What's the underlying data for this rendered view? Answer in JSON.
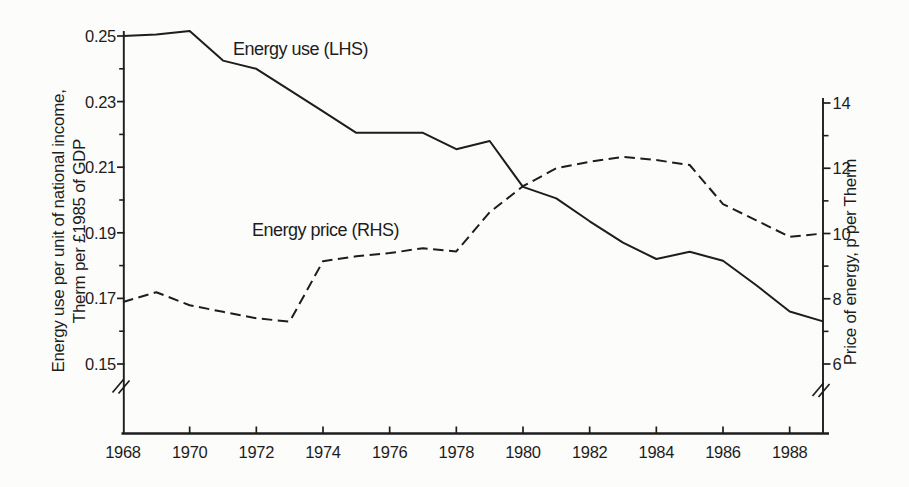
{
  "chart_data": {
    "type": "line",
    "x": [
      1968,
      1969,
      1970,
      1971,
      1972,
      1973,
      1974,
      1975,
      1976,
      1977,
      1978,
      1979,
      1980,
      1981,
      1982,
      1983,
      1984,
      1985,
      1986,
      1987,
      1988,
      1989
    ],
    "x_axis": {
      "range": [
        1968,
        1989
      ],
      "tick_years": [
        1970,
        1972,
        1974,
        1976,
        1978,
        1980,
        1982,
        1984,
        1986,
        1988
      ],
      "label_years": [
        1968,
        1970,
        1972,
        1974,
        1976,
        1978,
        1980,
        1982,
        1984,
        1986,
        1988
      ],
      "labels": [
        "1968",
        "1970",
        "1972",
        "1974",
        "1976",
        "1978",
        "1980",
        "1982",
        "1984",
        "1986",
        "1988"
      ]
    },
    "left_axis": {
      "title_line1": "Energy use per unit of national income,",
      "title_line2": "Therm per £1985 of GDP",
      "range": [
        0.15,
        0.25
      ],
      "tick_values": [
        0.15,
        0.17,
        0.19,
        0.21,
        0.23,
        0.25
      ],
      "tick_labels": [
        "0.15",
        "0.17",
        "0.19",
        "0.21",
        "0.23",
        "0.25"
      ],
      "minor_tick_values": [
        0.16,
        0.18,
        0.2,
        0.22,
        0.24
      ],
      "axis_break": true
    },
    "right_axis": {
      "title": "Price of energy, p per Therm",
      "range": [
        6,
        14
      ],
      "tick_values": [
        6,
        8,
        10,
        12,
        14
      ],
      "tick_labels": [
        "6",
        "8",
        "10",
        "12",
        "14"
      ],
      "minor_tick_values": [
        7,
        9,
        11,
        13
      ],
      "axis_break": true
    },
    "series": [
      {
        "name": "energy_use",
        "label": "Energy use (LHS)",
        "axis": "left",
        "line_style": "solid",
        "values": [
          0.25,
          0.2505,
          0.2515,
          0.2425,
          0.24,
          0.2335,
          0.227,
          0.2205,
          0.2205,
          0.2205,
          0.2155,
          0.218,
          0.204,
          0.2005,
          0.1935,
          0.187,
          0.182,
          0.1842,
          0.1815,
          0.174,
          0.166,
          0.163
        ]
      },
      {
        "name": "energy_price",
        "label": "Energy price (RHS)",
        "axis": "right",
        "line_style": "dashed",
        "values": [
          7.9,
          8.2,
          7.8,
          7.6,
          7.4,
          7.3,
          9.15,
          9.3,
          9.4,
          9.55,
          9.45,
          10.65,
          11.45,
          12.0,
          12.2,
          12.35,
          12.25,
          12.1,
          10.9,
          10.4,
          9.9,
          10.0
        ]
      }
    ],
    "colors": {
      "ink": "#1d1d1d",
      "paper": "#fcfcfa"
    },
    "legend_position": "inline-labels",
    "grid": false
  }
}
